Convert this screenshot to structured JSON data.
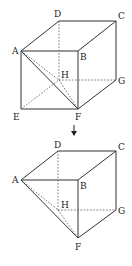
{
  "figure": {
    "top_cube": {
      "labels": {
        "A": "A",
        "B": "B",
        "C": "C",
        "D": "D",
        "E": "E",
        "F": "F",
        "G": "G",
        "H": "H"
      }
    },
    "arrow": "↓",
    "bottom_solid": {
      "labels": {
        "A": "A",
        "B": "B",
        "C": "C",
        "D": "D",
        "F": "F",
        "G": "G",
        "H": "H"
      }
    }
  }
}
